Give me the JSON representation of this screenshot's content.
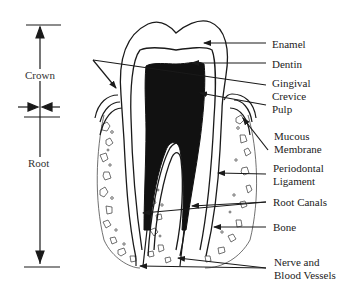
{
  "diagram": {
    "regions": [
      {
        "id": "crown",
        "label": "Crown"
      },
      {
        "id": "root",
        "label": "Root"
      }
    ],
    "labels": [
      {
        "id": "enamel",
        "lines": [
          "Enamel"
        ]
      },
      {
        "id": "dentin",
        "lines": [
          "Dentin"
        ]
      },
      {
        "id": "gingival-crevice",
        "lines": [
          "Gingival",
          "Crevice"
        ]
      },
      {
        "id": "pulp",
        "lines": [
          "Pulp"
        ]
      },
      {
        "id": "mucous-membrane",
        "lines": [
          "Mucous",
          "Membrane"
        ]
      },
      {
        "id": "periodontal-ligament",
        "lines": [
          "Periodontal",
          "Ligament"
        ]
      },
      {
        "id": "root-canals",
        "lines": [
          "Root Canals"
        ]
      },
      {
        "id": "bone",
        "lines": [
          "Bone"
        ]
      },
      {
        "id": "nerve-blood-vessels",
        "lines": [
          "Nerve and",
          "Blood Vessels"
        ]
      }
    ],
    "colors": {
      "line": "#1a1a1a",
      "pulp_fill": "#111111",
      "background": "#ffffff"
    }
  }
}
